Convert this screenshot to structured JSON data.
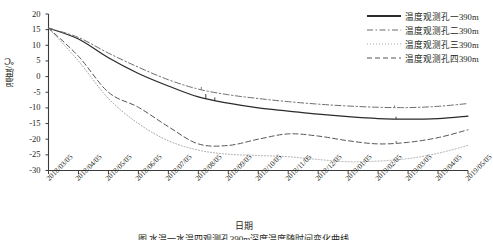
{
  "figure": {
    "caption": "图      水温一水温四观测孔390m深度温度随时间变化曲线",
    "xlabel": "日期",
    "ylabel": "温度/℃"
  },
  "axes": {
    "y_ticks": [
      "20",
      "15",
      "10",
      "5",
      "0",
      "-5",
      "-10",
      "-15",
      "-20",
      "-25",
      "-30"
    ],
    "x_ticks": [
      "2018/03/05",
      "2018/04/05",
      "2018/05/05",
      "2018/06/05",
      "2018/07/05",
      "2018/08/05",
      "2018/09/05",
      "2018/10/05",
      "2018/11/05",
      "2018/12/05",
      "2019/01/05",
      "2019/02/05",
      "2019/03/05",
      "2019/04/05",
      "2019/05/05"
    ]
  },
  "legend": {
    "items": [
      {
        "label": "温度观测孔一390m",
        "style": "solid",
        "color": "#2a2a2a"
      },
      {
        "label": "温度观测孔二390m",
        "style": "dashdot",
        "color": "#6e6e6e"
      },
      {
        "label": "温度观测孔三390m",
        "style": "dotted",
        "color": "#a8a8a8"
      },
      {
        "label": "温度观测孔四390m",
        "style": "dashed",
        "color": "#555555"
      }
    ]
  },
  "chart_data": {
    "type": "line",
    "title": "",
    "xlabel": "日期",
    "ylabel": "温度/℃",
    "ylim": [
      -30,
      20
    ],
    "grid": false,
    "legend_position": "top-right",
    "x": [
      "2018/03/05",
      "2018/04/05",
      "2018/05/05",
      "2018/06/05",
      "2018/07/05",
      "2018/08/05",
      "2018/09/05",
      "2018/10/05",
      "2018/11/05",
      "2018/12/05",
      "2019/01/05",
      "2019/02/05",
      "2019/03/05",
      "2019/04/05",
      "2019/05/05"
    ],
    "series": [
      {
        "name": "温度观测孔一390m",
        "style": "solid",
        "color": "#2a2a2a",
        "values": [
          15.5,
          12.0,
          6.0,
          1.0,
          -3.0,
          -6.5,
          -8.5,
          -10.0,
          -11.0,
          -12.0,
          -12.8,
          -13.4,
          -13.6,
          -13.4,
          -12.6
        ]
      },
      {
        "name": "温度观测孔二390m",
        "style": "dashdot",
        "color": "#6e6e6e",
        "values": [
          15.5,
          12.5,
          7.5,
          3.0,
          -1.0,
          -4.0,
          -5.8,
          -7.0,
          -8.0,
          -8.8,
          -9.4,
          -9.8,
          -9.9,
          -9.5,
          -8.6
        ]
      },
      {
        "name": "温度观测孔三390m",
        "style": "dotted",
        "color": "#a8a8a8",
        "values": [
          15.5,
          5.0,
          -7.0,
          -15.0,
          -20.5,
          -23.5,
          -24.8,
          -25.2,
          -25.6,
          -26.5,
          -27.2,
          -27.0,
          -26.2,
          -24.5,
          -22.0
        ]
      },
      {
        "name": "温度观测孔四390m",
        "style": "dashed",
        "color": "#555555",
        "values": [
          15.5,
          6.5,
          -5.0,
          -9.8,
          -16.0,
          -21.5,
          -22.0,
          -20.0,
          -18.3,
          -19.0,
          -20.5,
          -21.5,
          -21.0,
          -19.5,
          -17.0
        ]
      }
    ]
  }
}
